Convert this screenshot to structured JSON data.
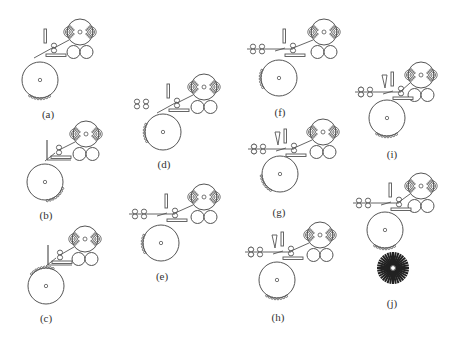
{
  "figure": {
    "stroke_color": "#555555",
    "panels": [
      {
        "id": "a",
        "label": "(a)",
        "cx": 80,
        "cy": 32,
        "drumX": 40,
        "drumY": 80,
        "lx": 48,
        "ly": 108,
        "feeders": 0,
        "cone": false,
        "brush": false,
        "web": "angled",
        "teeth": "bottom"
      },
      {
        "id": "b",
        "label": "(b)",
        "cx": 86,
        "cy": 134,
        "drumX": 45,
        "drumY": 182,
        "lx": 46,
        "ly": 209,
        "feeders": 0,
        "cone": false,
        "brush": false,
        "web": "corner",
        "teeth": "bottomright"
      },
      {
        "id": "c",
        "label": "(c)",
        "cx": 85,
        "cy": 239,
        "drumX": 46,
        "drumY": 286,
        "lx": 46,
        "ly": 312,
        "feeders": 0,
        "cone": false,
        "brush": false,
        "web": "corner",
        "teeth": "top"
      },
      {
        "id": "d",
        "label": "(d)",
        "cx": 204,
        "cy": 87,
        "drumX": 163,
        "drumY": 132,
        "lx": 164,
        "ly": 158,
        "feeders": 2,
        "cone": false,
        "brush": false,
        "web": "angled",
        "teeth": "left"
      },
      {
        "id": "e",
        "label": "(e)",
        "cx": 204,
        "cy": 197,
        "drumX": 161,
        "drumY": 243,
        "lx": 162,
        "ly": 270,
        "feeders": 2,
        "cone": false,
        "brush": false,
        "web": "straight",
        "teeth": "left"
      },
      {
        "id": "f",
        "label": "(f)",
        "cx": 324,
        "cy": 32,
        "drumX": 279,
        "drumY": 78,
        "lx": 280,
        "ly": 106,
        "feeders": 2,
        "cone": false,
        "brush": false,
        "web": "straight",
        "teeth": "left"
      },
      {
        "id": "g",
        "label": "(g)",
        "cx": 323,
        "cy": 132,
        "drumX": 280,
        "drumY": 174,
        "lx": 279,
        "ly": 206,
        "feeders": 2,
        "cone": true,
        "brush": false,
        "web": "straight",
        "teeth": "leftbottom"
      },
      {
        "id": "h",
        "label": "(h)",
        "cx": 320,
        "cy": 235,
        "drumX": 277,
        "drumY": 280,
        "lx": 278,
        "ly": 311,
        "feeders": 2,
        "cone": true,
        "brush": false,
        "web": "straight",
        "teeth": "bottom"
      },
      {
        "id": "i",
        "label": "(i)",
        "cx": 421,
        "cy": 75,
        "drumX": 387,
        "drumY": 118,
        "lx": 392,
        "ly": 148,
        "feeders": 2,
        "cone": true,
        "brush": false,
        "web": "straight",
        "teeth": "bottom"
      },
      {
        "id": "j",
        "label": "(j)",
        "cx": 421,
        "cy": 186,
        "drumX": 385,
        "drumY": 230,
        "lx": 392,
        "ly": 297,
        "feeders": 2,
        "cone": false,
        "brush": true,
        "web": "straight",
        "teeth": "bottom"
      }
    ]
  }
}
